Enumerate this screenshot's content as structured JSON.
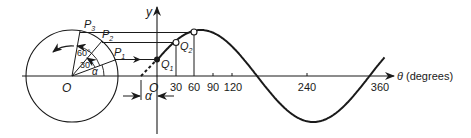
{
  "diagram": {
    "colors": {
      "ink": "#1a1a1a",
      "background": "#ffffff"
    },
    "circle": {
      "center_label": "O",
      "points": [
        {
          "label": "P",
          "sub": "1"
        },
        {
          "label": "P",
          "sub": "2"
        },
        {
          "label": "P",
          "sub": "3"
        }
      ],
      "angles": {
        "alpha": "α",
        "a30": "30°",
        "a60": "60°"
      }
    },
    "graph": {
      "y_axis_label": "y",
      "origin_label": "O",
      "x_axis_label": "θ (degrees)",
      "x_ticks": [
        "30",
        "60",
        "90",
        "120",
        "240",
        "360"
      ],
      "points": [
        {
          "label": "Q",
          "sub": "1"
        },
        {
          "label": "Q",
          "sub": "2"
        }
      ],
      "phase_label": "α"
    }
  }
}
